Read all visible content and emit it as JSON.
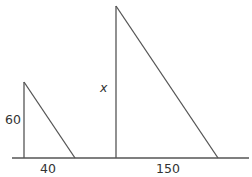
{
  "diagram": {
    "type": "similar-right-triangles",
    "baseline": {
      "x1": 12,
      "x2": 249,
      "y": 158
    },
    "triangles": [
      {
        "name": "small",
        "apex": [
          24,
          82
        ],
        "corner": [
          24,
          158
        ],
        "foot": [
          75,
          158
        ],
        "height_label": "60",
        "base_label": "40"
      },
      {
        "name": "large",
        "apex": [
          116,
          6
        ],
        "corner": [
          116,
          158
        ],
        "foot": [
          218,
          158
        ],
        "height_label": "x",
        "base_label": "150"
      }
    ],
    "stroke_color": "#555555",
    "text_color": "#333333"
  }
}
